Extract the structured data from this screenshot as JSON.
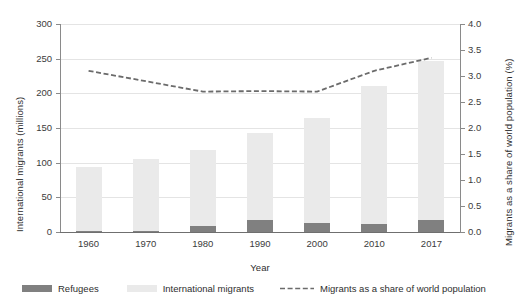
{
  "axes": {
    "y_left_title": "International migrants (millions)",
    "y_right_title": "Migrants as a share of world population (%)",
    "x_title": "Year",
    "y_left_ticks": [
      "0",
      "50",
      "100",
      "150",
      "200",
      "250",
      "300"
    ],
    "y_right_ticks": [
      "0.0",
      "0.5",
      "1.0",
      "1.5",
      "2.0",
      "2.5",
      "3.0",
      "3.5",
      "4.0"
    ],
    "x_ticks": [
      "1960",
      "1970",
      "1980",
      "1990",
      "2000",
      "2010",
      "2017"
    ]
  },
  "legend": {
    "refugees": "Refugees",
    "international_migrants": "International migrants",
    "share": "Migrants as a share of world population"
  },
  "colors": {
    "refugees": "#808080",
    "international_migrants": "#eaeaea",
    "share_line": "#6b6b6b",
    "gridline": "#e4e4e4",
    "axis": "#8a8a8a",
    "text": "#3b3b3b"
  },
  "chart_data": {
    "type": "bar",
    "title": "",
    "xlabel": "Year",
    "ylabel": "International migrants (millions)",
    "y2label": "Migrants as a share of world population (%)",
    "categories": [
      "1960",
      "1970",
      "1980",
      "1990",
      "2000",
      "2010",
      "2017"
    ],
    "ylim": [
      0,
      300
    ],
    "y2lim": [
      0,
      4.0
    ],
    "ytick_step": 50,
    "y2tick_step": 0.5,
    "grid": true,
    "legend_position": "bottom",
    "stacked": true,
    "series": [
      {
        "name": "Refugees",
        "type": "bar",
        "axis": "left",
        "unit": "millions",
        "values": [
          2,
          2,
          8,
          18,
          13,
          12,
          18
        ]
      },
      {
        "name": "International migrants",
        "type": "bar",
        "axis": "left",
        "unit": "millions",
        "values": [
          94,
          105,
          118,
          143,
          165,
          211,
          247
        ]
      },
      {
        "name": "Migrants as a share of world population",
        "type": "line",
        "style": "dashed",
        "axis": "right",
        "unit": "percent",
        "values": [
          3.1,
          2.9,
          2.7,
          2.71,
          2.7,
          3.1,
          3.35
        ]
      }
    ]
  }
}
